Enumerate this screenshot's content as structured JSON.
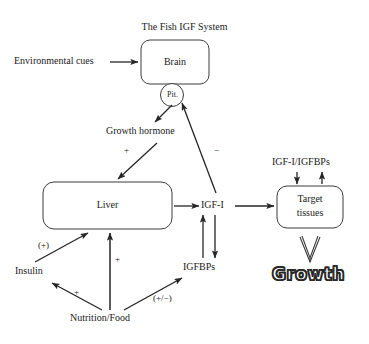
{
  "diagram": {
    "title": "The Fish IGF System",
    "nodes": {
      "environmental_cues": "Environmental cues",
      "brain": "Brain",
      "pituitary": "Pit.",
      "growth_hormone": "Growth hormone",
      "liver": "Liver",
      "igf1": "IGF-I",
      "igfbps": "IGFBPs",
      "insulin": "Insulin",
      "nutrition": "Nutrition/Food",
      "igf1_igfbps": "IGF-I/IGFBPs",
      "target_tissues_line1": "Target",
      "target_tissues_line2": "tissues",
      "growth": "Growth"
    },
    "edge_labels": {
      "gh_to_liver": "+",
      "igf1_to_pituitary": "−",
      "insulin_to_liver": "(+)",
      "nutrition_to_liver": "+",
      "nutrition_to_insulin": "+",
      "nutrition_to_igfbps": "(+/−)"
    },
    "colors": {
      "background": "#ffffff",
      "stroke": "#262626",
      "text": "#1a1a1a",
      "growth_fill": "#ffffff",
      "growth_outline": "#262626"
    }
  }
}
